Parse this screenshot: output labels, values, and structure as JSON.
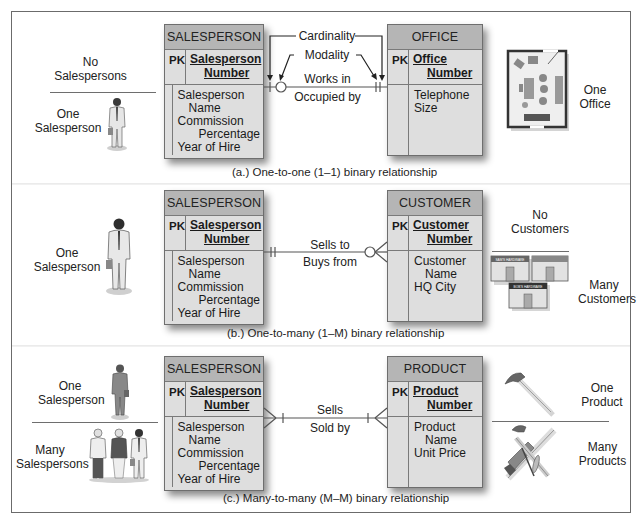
{
  "sections": [
    {
      "id": "a",
      "caption": "(a.) One-to-one (1–1) binary relationship",
      "left_entity": {
        "name": "SALESPERSON",
        "pk_label": "PK",
        "pk": [
          "Salesperson",
          "Number"
        ],
        "attributes": [
          "Salesperson",
          "Name",
          "Commission",
          "Percentage",
          "Year of Hire"
        ]
      },
      "right_entity": {
        "name": "OFFICE",
        "pk_label": "PK",
        "pk": [
          "Office",
          "Number"
        ],
        "attributes": [
          "Telephone",
          "Size"
        ]
      },
      "relationship": {
        "forward": "Works in",
        "reverse": "Occupied by",
        "left_end": "zero-or-one",
        "right_end": "one-and-only-one",
        "annotations": [
          "Cardinality",
          "Modality"
        ]
      },
      "left_illustration": {
        "top_label": [
          "No",
          "Salespersons"
        ],
        "bottom_label": [
          "One",
          "Salesperson"
        ],
        "icon": "salesperson-figure"
      },
      "right_illustration": {
        "label": [
          "One",
          "Office"
        ],
        "icon": "office-floorplan"
      }
    },
    {
      "id": "b",
      "caption": "(b.) One-to-many (1–M) binary relationship",
      "left_entity": {
        "name": "SALESPERSON",
        "pk_label": "PK",
        "pk": [
          "Salesperson",
          "Number"
        ],
        "attributes": [
          "Salesperson",
          "Name",
          "Commission",
          "Percentage",
          "Year of Hire"
        ]
      },
      "right_entity": {
        "name": "CUSTOMER",
        "pk_label": "PK",
        "pk": [
          "Customer",
          "Number"
        ],
        "attributes": [
          "Customer",
          "Name",
          "HQ City"
        ]
      },
      "relationship": {
        "forward": "Sells to",
        "reverse": "Buys from",
        "left_end": "one-and-only-one",
        "right_end": "zero-or-many"
      },
      "left_illustration": {
        "label": [
          "One",
          "Salesperson"
        ],
        "icon": "salesperson-figure"
      },
      "right_illustration": {
        "top_label": [
          "No",
          "Customers"
        ],
        "bottom_label": [
          "Many",
          "Customers"
        ],
        "icon": "hardware-stores",
        "store_signs": [
          "SAM'S HARDWARE",
          "",
          "BOB'S HARDWARE"
        ]
      }
    },
    {
      "id": "c",
      "caption": "(c.) Many-to-many (M–M) binary relationship",
      "left_entity": {
        "name": "SALESPERSON",
        "pk_label": "PK",
        "pk": [
          "Salesperson",
          "Number"
        ],
        "attributes": [
          "Salesperson",
          "Name",
          "Commission",
          "Percentage",
          "Year of Hire"
        ]
      },
      "right_entity": {
        "name": "PRODUCT",
        "pk_label": "PK",
        "pk": [
          "Product",
          "Number"
        ],
        "attributes": [
          "Product",
          "Name",
          "Unit Price"
        ]
      },
      "relationship": {
        "forward": "Sells",
        "reverse": "Sold by",
        "left_end": "one-or-many",
        "right_end": "one-or-many"
      },
      "left_illustration": {
        "top_label": [
          "One",
          "Salesperson"
        ],
        "bottom_label": [
          "Many",
          "Salespersons"
        ],
        "icon": "salesperson-group"
      },
      "right_illustration": {
        "top_label": [
          "One",
          "Product"
        ],
        "bottom_label": [
          "Many",
          "Products"
        ],
        "icon": "tools"
      }
    }
  ],
  "colors": {
    "entity_header": "#b5b5b5",
    "entity_body": "#dedede",
    "border": "#6e6e6e",
    "line": "#555555"
  }
}
